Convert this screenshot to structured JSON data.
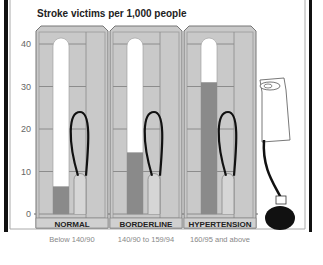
{
  "chart_data": {
    "type": "bar",
    "title": "Stroke victims per 1,000 people",
    "xlabel": "",
    "ylabel": "",
    "ylim": [
      0,
      40
    ],
    "yticks": [
      0,
      10,
      20,
      30,
      40
    ],
    "categories": [
      "NORMAL",
      "BORDERLINE",
      "HYPERTENSION"
    ],
    "sublabels": [
      "Below 140/90",
      "140/90 to 159/94",
      "160/95 and above"
    ],
    "values": [
      6.5,
      14.5,
      31
    ],
    "grid": true,
    "legend": "none",
    "colors": {
      "bar": "#8a8a8a",
      "tube": "#ffffff",
      "panel": "#c9c9c9",
      "outline": "#777777",
      "text": "#222222",
      "subtext": "#888888"
    }
  }
}
